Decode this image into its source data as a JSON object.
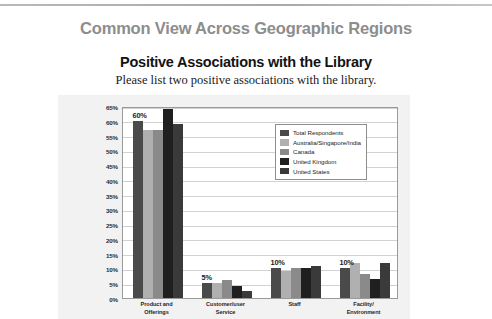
{
  "slide": {
    "title": "Common View Across Geographic Regions"
  },
  "chart_data": {
    "type": "bar",
    "title": "Positive Associations with the Library",
    "subtitle": "Please list two positive associations with the library.",
    "xlabel": "",
    "ylabel": "",
    "ylim": [
      0,
      65
    ],
    "ytick_step": 5,
    "yticks": [
      "0%",
      "5%",
      "10%",
      "15%",
      "20%",
      "25%",
      "30%",
      "35%",
      "40%",
      "45%",
      "50%",
      "55%",
      "60%",
      "65%"
    ],
    "grid": true,
    "legend_position": "top-right-inside",
    "categories": [
      "Product and Offerings",
      "Customer/user Service",
      "Staff",
      "Facility/ Environment"
    ],
    "category_lines": [
      [
        "Product and",
        "Offerings"
      ],
      [
        "Customer/user",
        "Service"
      ],
      [
        "Staff"
      ],
      [
        "Facility/",
        "Environment"
      ]
    ],
    "series": [
      {
        "name": "Total Respondents",
        "color": "#4a4a4a",
        "values": [
          60,
          5,
          10,
          10
        ]
      },
      {
        "name": "Australia/Singapore/India",
        "color": "#b0b0b0",
        "values": [
          57,
          5,
          9,
          12
        ]
      },
      {
        "name": "Canada",
        "color": "#8a8a8a",
        "values": [
          57,
          6,
          10,
          8
        ]
      },
      {
        "name": "United Kingdom",
        "color": "#1f1f1f",
        "values": [
          64,
          4,
          10,
          6.5
        ]
      },
      {
        "name": "United States",
        "color": "#3a3a3a",
        "values": [
          59,
          2.5,
          11,
          12
        ]
      }
    ],
    "annotations": [
      {
        "category": "Product and Offerings",
        "text": "60%"
      },
      {
        "category": "Customer/user Service",
        "text": "5%"
      },
      {
        "category": "Staff",
        "text": "10%"
      },
      {
        "category": "Facility/ Environment",
        "text": "10%"
      }
    ],
    "colors": {
      "panel_background": "#f2f2f2",
      "plot_background": "#ffffff",
      "grid": "#d2d2d2",
      "axis": "#9a9a9a",
      "title": "#131313",
      "slide_title": "#8d8d8d"
    }
  }
}
